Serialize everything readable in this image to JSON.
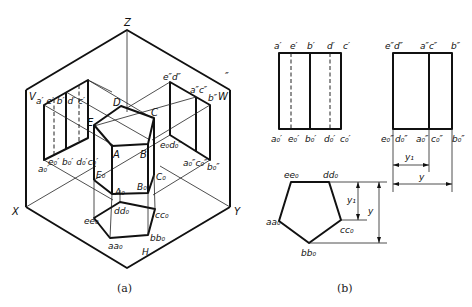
{
  "figure_a": {
    "caption": "(a)",
    "axes": {
      "z": "Z",
      "x": "X",
      "y": "Y"
    },
    "planes": {
      "v": "V",
      "w": "W",
      "h": "H",
      "w_prime": "″"
    },
    "solid_vertices": {
      "A": "A",
      "B": "B",
      "C": "C",
      "D": "D",
      "E": "E",
      "A0": "A₀",
      "B0": "B₀",
      "C0": "C₀",
      "E0": "E₀"
    },
    "v_projection": {
      "top": "a′ e′ b′ d′ c′",
      "bottom_left": "a₀′",
      "bottom": "e₀′ b₀′ d₀′c₀′"
    },
    "w_projection": {
      "top_left": "e″d″",
      "top_mid": "a″c″",
      "top_right": "b″",
      "bottom_left": "e₀d₀″",
      "bottom_mid": "a₀″c₀″",
      "bottom_right": "b₀″"
    },
    "h_projection": {
      "ee0": "ee₀",
      "dd0": "dd₀",
      "cc0": "cc₀",
      "bb0": "bb₀",
      "aa0": "aa₀"
    }
  },
  "figure_b": {
    "caption": "(b)",
    "front_view": {
      "top_labels": [
        "a′",
        "e′",
        "b′",
        "d′",
        "c′"
      ],
      "bottom_labels": [
        "a₀′",
        "e₀′",
        "b₀′",
        "d₀′",
        "c₀′"
      ]
    },
    "side_view": {
      "top_labels": [
        "e″d″",
        "a″c″",
        "b″"
      ],
      "bottom_labels": [
        "e₀″",
        "d₀″",
        "a₀″",
        "c₀″",
        "b₀″"
      ],
      "dim_y1": "y₁",
      "dim_y": "y"
    },
    "top_view": {
      "labels": {
        "ee0": "ee₀",
        "dd0": "dd₀",
        "cc0": "cc₀",
        "bb0": "bb₀",
        "aa0": "aa₀"
      },
      "dim_y1": "y₁",
      "dim_y": "y"
    }
  }
}
